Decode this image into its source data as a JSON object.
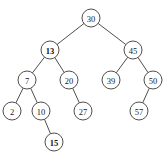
{
  "diagram": {
    "type": "binary-search-tree",
    "node_radius": 9,
    "colors": {
      "stroke": "#3a3a3a",
      "fill": "#ffffff",
      "text": "#222222"
    },
    "nodes": [
      {
        "id": "n30",
        "label": "30",
        "x": 91,
        "y": 18,
        "bold": false
      },
      {
        "id": "n13",
        "label": "13",
        "x": 50,
        "y": 50,
        "bold": true
      },
      {
        "id": "n45",
        "label": "45",
        "x": 133,
        "y": 50,
        "bold": false
      },
      {
        "id": "n7",
        "label": "7",
        "x": 27,
        "y": 80,
        "bold": false
      },
      {
        "id": "n20",
        "label": "20",
        "x": 69,
        "y": 80,
        "bold": false
      },
      {
        "id": "n39",
        "label": "39",
        "x": 111,
        "y": 80,
        "bold": false
      },
      {
        "id": "n50",
        "label": "50",
        "x": 153,
        "y": 80,
        "bold": false
      },
      {
        "id": "n2",
        "label": "2",
        "x": 12,
        "y": 111,
        "bold": false
      },
      {
        "id": "n10",
        "label": "10",
        "x": 41,
        "y": 111,
        "bold": false
      },
      {
        "id": "n27",
        "label": "27",
        "x": 83,
        "y": 111,
        "bold": false
      },
      {
        "id": "n57",
        "label": "57",
        "x": 139,
        "y": 111,
        "bold": false
      },
      {
        "id": "n15",
        "label": "15",
        "x": 54,
        "y": 142,
        "bold": true
      }
    ],
    "edges": [
      {
        "from": "n30",
        "to": "n13"
      },
      {
        "from": "n30",
        "to": "n45"
      },
      {
        "from": "n13",
        "to": "n7"
      },
      {
        "from": "n13",
        "to": "n20"
      },
      {
        "from": "n45",
        "to": "n39"
      },
      {
        "from": "n45",
        "to": "n50"
      },
      {
        "from": "n7",
        "to": "n2"
      },
      {
        "from": "n7",
        "to": "n10"
      },
      {
        "from": "n20",
        "to": "n27"
      },
      {
        "from": "n50",
        "to": "n57"
      },
      {
        "from": "n10",
        "to": "n15"
      }
    ]
  }
}
